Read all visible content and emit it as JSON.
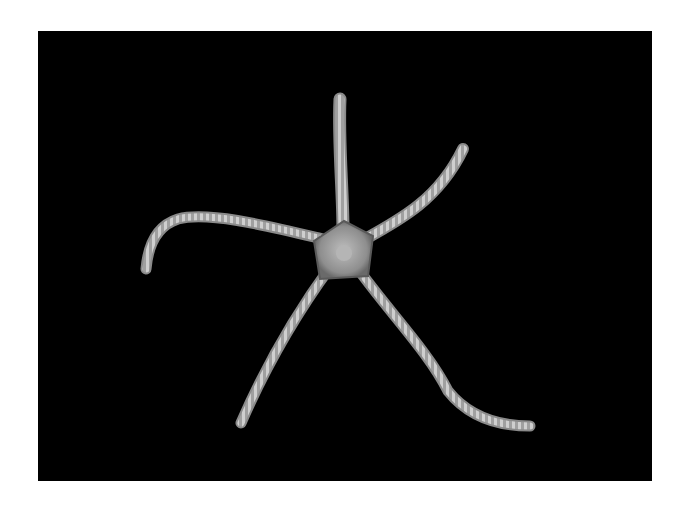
{
  "image": {
    "subject": "brittle star",
    "background_color": "#000000",
    "border_color": "#ffffff",
    "arm_count": 5,
    "colors": {
      "arm": "#a8a8a8",
      "arm_light": "#d6d6d6",
      "disc": "#9a9a9a"
    }
  }
}
